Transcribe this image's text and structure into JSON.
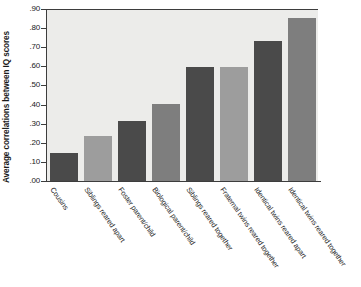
{
  "chart_data": {
    "type": "bar",
    "title": "",
    "subtitle": "",
    "xlabel": "",
    "ylabel": "Average correlations between IQ scores",
    "ylim": [
      0.0,
      0.9
    ],
    "grid": false,
    "legend": "none",
    "y_ticks": [
      ".00",
      ".10",
      ".20",
      ".30",
      ".40",
      ".50",
      ".60",
      ".70",
      ".80",
      ".90"
    ],
    "y_tick_values": [
      0.0,
      0.1,
      0.2,
      0.3,
      0.4,
      0.5,
      0.6,
      0.7,
      0.8,
      0.9
    ],
    "categories": [
      "Cousins",
      "Siblings reared apart",
      "Foster parent/child",
      "Biological parent/child",
      "Siblings reared together",
      "Fraternal twins reared together",
      "Identical twins reared apart",
      "Identical twins reared together"
    ],
    "values": [
      0.15,
      0.24,
      0.32,
      0.41,
      0.6,
      0.6,
      0.74,
      0.86
    ],
    "bar_colors": [
      "#4a4a4a",
      "#9d9d9d",
      "#4a4a4a",
      "#7e7e7e",
      "#4a4a4a",
      "#9d9d9d",
      "#4a4a4a",
      "#7e7e7e"
    ],
    "plot_background": "#ececea",
    "axis_color": "#3d3d3d",
    "page_background": "#ffffff"
  }
}
